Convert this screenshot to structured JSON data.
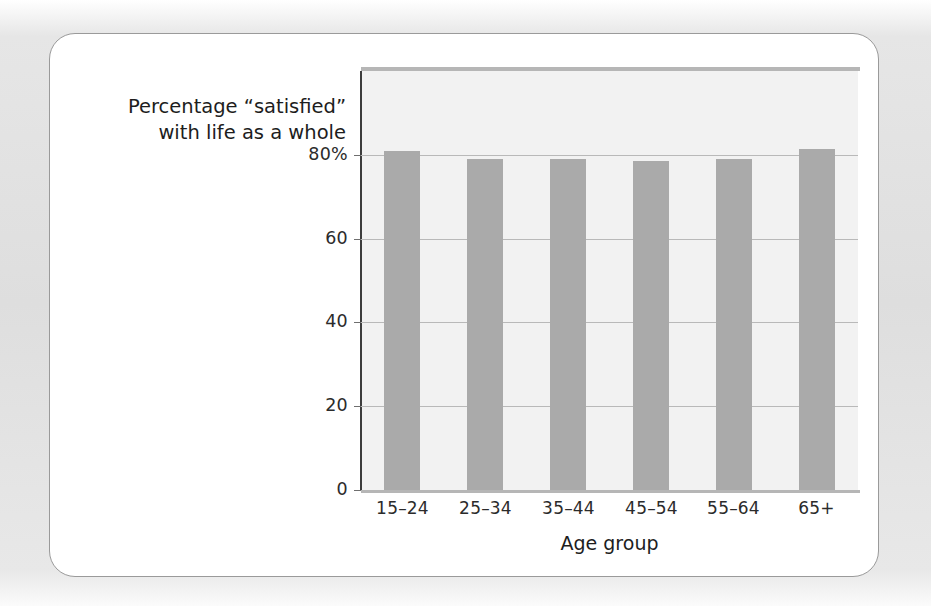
{
  "chart_data": {
    "type": "bar",
    "title": "",
    "subtitle": "",
    "ylabel_line1": "Percentage “satisfied”",
    "ylabel_line2": "with life as a whole",
    "xlabel": "Age group",
    "categories": [
      "15–24",
      "25–34",
      "35–44",
      "45–54",
      "55–64",
      "65+"
    ],
    "values": [
      81,
      79,
      79,
      78.5,
      79,
      81.5
    ],
    "ytick_labels": [
      "80%",
      "60",
      "40",
      "20",
      "0"
    ],
    "ytick_values": [
      80,
      60,
      40,
      20,
      0
    ],
    "ylim": [
      0,
      100
    ],
    "grid": true,
    "legend": "none",
    "bar_color": "#aaaaaa",
    "plot_background": "#f2f2f2",
    "axis_color": "#3d3d3d",
    "gridline_color": "#b9b9b9"
  },
  "figure": {
    "card_background": "#ffffff",
    "card_border_color": "#9a9a9a",
    "page_background": "#e2e2e2"
  }
}
